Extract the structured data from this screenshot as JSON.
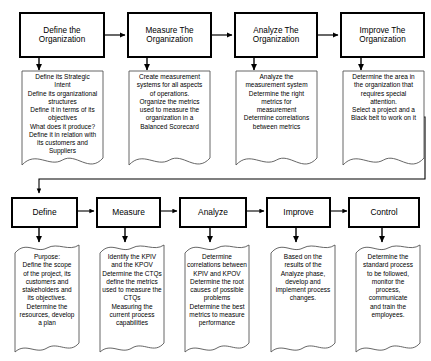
{
  "diagram": {
    "colors": {
      "background": "#ffffff",
      "box_border": "#000000",
      "shape_outline": "#555555",
      "text": "#000000",
      "connector": "#000000"
    },
    "row1": {
      "name": "Organization Level Phases",
      "stages": [
        {
          "label": "Define the\nOrganization",
          "detail": "Define its Strategic\nIntent\nDefine its organizational\nstructures\nDefine it in terms of its\nobjectives\nWhat does it produce?\nDefine it in relation with\nits customers and\nSuppliers"
        },
        {
          "label": "Measure The\nOrganization",
          "detail": "Create measurement\nsystems for all aspects\nof operations.\nOrganize the metrics\nused to measure the\norganization in a\nBalanced Scorecard"
        },
        {
          "label": "Analyze The\nOrganization",
          "detail": "Analyze the\nmeasurement system\nDetermine the right\nmetrics for\nmeasurement\nDetermine correlations\nbetween metrics"
        },
        {
          "label": "Improve The\nOrganization",
          "detail": "Determine the area in\nthe organization that\nrequires special\nattention.\nSelect a project and a\nBlack belt to work on it"
        }
      ]
    },
    "row2": {
      "name": "Project Level DMAIC Phases",
      "stages": [
        {
          "label": "Define",
          "detail": "Purpose:\nDefine the scope\nof the project, its\ncustomers and\nstakeholders and\nits objectives.\nDetermine the\nresources, develop\na plan"
        },
        {
          "label": "Measure",
          "detail": "Identify the KPIV\nand the KPOV\nDetermine the CTQs\ndefine the metrics\nused to measure the\nCTQs\nMeasuring the\ncurrent process\ncapabilities"
        },
        {
          "label": "Analyze",
          "detail": "Determine\ncorrelations between\nKPIV and KPOV\nDetermine the root\ncauses of possible\nproblems\nDetermine the best\nmetrics to measure\nperformance"
        },
        {
          "label": "Improve",
          "detail": "Based on the\nresults of the\nAnalyze phase,\ndevelop and\nimplement process\nchanges."
        },
        {
          "label": "Control",
          "detail": "Determine the\nstandard process\nto be followed,\nmonitor the\nprocess,\ncommunicate\nand train the\nemployees."
        }
      ]
    }
  }
}
